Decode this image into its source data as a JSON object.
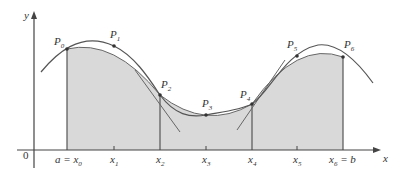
{
  "diagram": {
    "type": "simpsons-rule-illustration",
    "colors": {
      "shading": "#d9d9d9",
      "curve": "#555555",
      "axis": "#444444",
      "parabola_arcs": "#666666",
      "text": "#333333"
    },
    "axes": {
      "x_label": "x",
      "y_label": "y",
      "origin_label": "0"
    },
    "points": [
      {
        "name": "P",
        "sub": "0",
        "x": 67,
        "y": 49
      },
      {
        "name": "P",
        "sub": "1",
        "x": 114,
        "y": 46
      },
      {
        "name": "P",
        "sub": "2",
        "x": 160,
        "y": 95
      },
      {
        "name": "P",
        "sub": "3",
        "x": 206,
        "y": 115
      },
      {
        "name": "P",
        "sub": "4",
        "x": 252,
        "y": 104
      },
      {
        "name": "P",
        "sub": "5",
        "x": 297,
        "y": 56
      },
      {
        "name": "P",
        "sub": "6",
        "x": 343,
        "y": 57
      }
    ],
    "x_ticks": [
      {
        "prefix": "a = ",
        "name": "x",
        "sub": "0",
        "suffix": ""
      },
      {
        "prefix": "",
        "name": "x",
        "sub": "1",
        "suffix": ""
      },
      {
        "prefix": "",
        "name": "x",
        "sub": "2",
        "suffix": ""
      },
      {
        "prefix": "",
        "name": "x",
        "sub": "3",
        "suffix": ""
      },
      {
        "prefix": "",
        "name": "x",
        "sub": "4",
        "suffix": ""
      },
      {
        "prefix": "",
        "name": "x",
        "sub": "5",
        "suffix": ""
      },
      {
        "prefix": "",
        "name": "x",
        "sub": "6",
        "suffix": " = b"
      }
    ]
  }
}
